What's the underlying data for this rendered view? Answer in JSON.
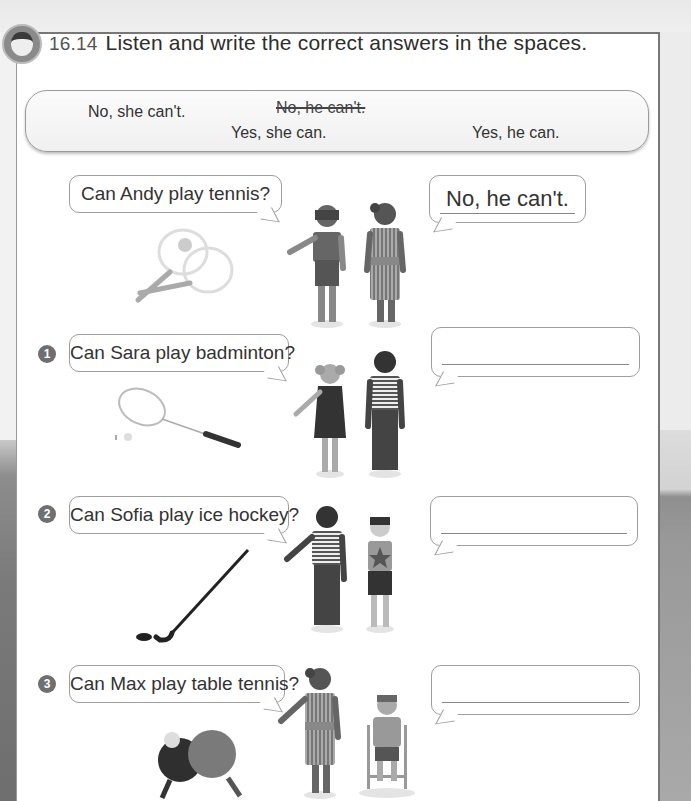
{
  "exercise": {
    "number": "16.14",
    "instruction": "Listen and write the correct answers in the spaces.",
    "icon": "listening-child-headphones-icon"
  },
  "word_bank": [
    {
      "text": "No, she can't.",
      "struck": false
    },
    {
      "text": "No, he can't.",
      "struck": true
    },
    {
      "text": "Yes, she can.",
      "struck": false
    },
    {
      "text": "Yes, he can.",
      "struck": false
    }
  ],
  "example": {
    "question": "Can Andy play tennis?",
    "answer": "No, he can't.",
    "equipment": "tennis-rackets-and-ball"
  },
  "items": [
    {
      "number": "1",
      "question": "Can Sara play badminton?",
      "answer": "",
      "equipment": "badminton-racket-and-shuttlecock"
    },
    {
      "number": "2",
      "question": "Can Sofia play ice hockey?",
      "answer": "",
      "equipment": "hockey-stick-and-puck"
    },
    {
      "number": "3",
      "question": "Can Max play table tennis?",
      "answer": "",
      "equipment": "table-tennis-paddles-and-ball"
    }
  ]
}
